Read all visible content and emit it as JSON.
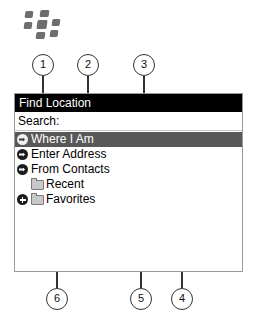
{
  "brand": {
    "logo_name": "blackberry-logo"
  },
  "panel": {
    "title": "Find Location",
    "search_label": "Search:",
    "search_value": "",
    "rows": [
      {
        "id": "where-i-am",
        "label": "Where I Am",
        "icon": "circle-arrow-icon",
        "selected": true,
        "indent": false,
        "expandable": false
      },
      {
        "id": "enter-address",
        "label": "Enter Address",
        "icon": "circle-arrow-icon",
        "selected": false,
        "indent": false,
        "expandable": false
      },
      {
        "id": "from-contacts",
        "label": "From Contacts",
        "icon": "circle-arrow-icon",
        "selected": false,
        "indent": false,
        "expandable": false
      },
      {
        "id": "recent",
        "label": "Recent",
        "icon": "folder-icon",
        "selected": false,
        "indent": true,
        "expandable": false
      },
      {
        "id": "favorites",
        "label": "Favorites",
        "icon": "folder-icon",
        "selected": false,
        "indent": false,
        "expandable": true
      }
    ]
  },
  "callouts": [
    {
      "n": "1",
      "target": "title-bar"
    },
    {
      "n": "2",
      "target": "search-field"
    },
    {
      "n": "3",
      "target": "enter-address-row"
    },
    {
      "n": "4",
      "target": "from-contacts-row"
    },
    {
      "n": "5",
      "target": "recent-row"
    },
    {
      "n": "6",
      "target": "favorites-row"
    }
  ],
  "colors": {
    "titlebar_bg": "#000000",
    "selected_row_bg": "#585858",
    "panel_border": "#9a9a9a",
    "callout_stroke": "#333333",
    "logo_gray": "#6e6e6e"
  }
}
